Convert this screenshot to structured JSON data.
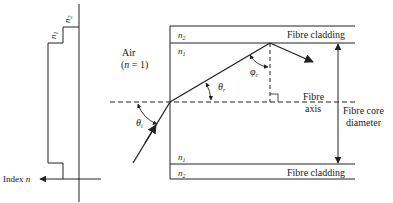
{
  "colors": {
    "ink": "#222222",
    "background": "#ffffff"
  },
  "index_profile": {
    "core_label": "n",
    "core_sub": "1",
    "cladding_label": "n",
    "cladding_sub": "2",
    "axis_label_prefix": "Index ",
    "axis_label_var": "n"
  },
  "fibre": {
    "medium_label": "Air",
    "medium_index": "(n = 1)",
    "top_cladding_n": "n",
    "top_cladding_sub": "2",
    "top_core_n": "n",
    "top_core_sub": "1",
    "bottom_core_n": "n",
    "bottom_core_sub": "1",
    "bottom_cladding_n": "n",
    "bottom_cladding_sub": "2",
    "top_cladding_label": "Fibre cladding",
    "bottom_cladding_label": "Fibre cladding",
    "axis_label_line1": "Fibre",
    "axis_label_line2": "axis",
    "diameter_label_line1": "Fibre core",
    "diameter_label_line2": "diameter"
  },
  "angles": {
    "incidence": "θ",
    "incidence_sub": "i",
    "refraction": "θ",
    "refraction_sub": "r",
    "critical": "φ",
    "critical_sub": "c"
  }
}
